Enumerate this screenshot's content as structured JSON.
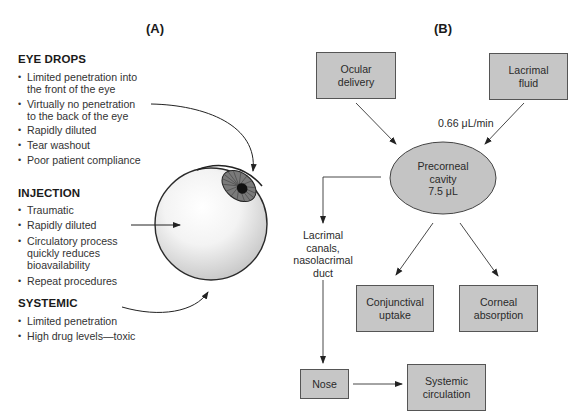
{
  "panel_a": {
    "title": "(A)",
    "sections": [
      {
        "heading": "EYE DROPS",
        "items": [
          [
            "Limited penetration into",
            "the front of the eye"
          ],
          [
            "Virtually no penetration",
            "to the back of the eye"
          ],
          [
            "Rapidly diluted"
          ],
          [
            "Tear washout"
          ],
          [
            "Poor patient compliance"
          ]
        ]
      },
      {
        "heading": "INJECTION",
        "items": [
          [
            "Traumatic"
          ],
          [
            "Rapidly diluted"
          ],
          [
            "Circulatory process",
            "quickly reduces",
            "bioavailability"
          ],
          [
            "Repeat procedures"
          ]
        ]
      },
      {
        "heading": "SYSTEMIC",
        "items": [
          [
            "Limited penetration"
          ],
          [
            "High drug levels—toxic"
          ]
        ]
      }
    ]
  },
  "panel_b": {
    "title": "(B)",
    "nodes": {
      "ocular_delivery": [
        "Ocular",
        "delivery"
      ],
      "lacrimal_fluid": [
        "Lacrimal",
        "fluid"
      ],
      "precorneal": [
        "Precorneal",
        "cavity",
        "7.5 μL"
      ],
      "conjunctival": [
        "Conjunctival",
        "uptake"
      ],
      "corneal": [
        "Corneal",
        "absorption"
      ],
      "nose": [
        "Nose"
      ],
      "systemic": [
        "Systemic",
        "circulation"
      ]
    },
    "flow_label": "0.66 μL/min",
    "drain_label": [
      "Lacrimal",
      "canals,",
      "nasolacrimal",
      "duct"
    ]
  },
  "colors": {
    "box_fill": "#c6c6c6",
    "ellipse_fill": "#c4c4c4",
    "iris_fill": "#7a7a7a",
    "pupil": "#111111",
    "line": "#333333"
  }
}
